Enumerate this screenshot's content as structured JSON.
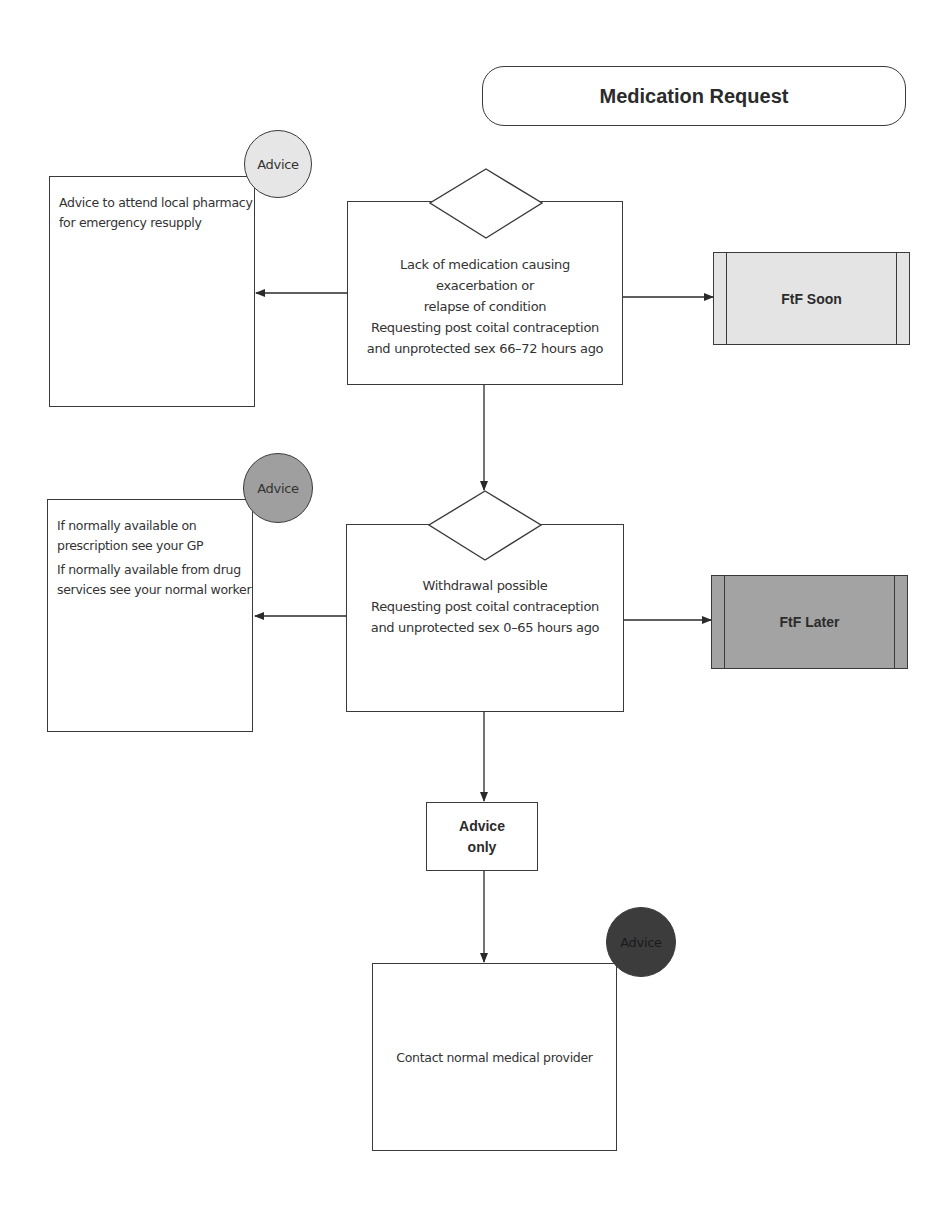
{
  "diagram": {
    "title": "Medication Request",
    "colors": {
      "advice_light": "#e6e6e6",
      "advice_medium": "#9f9f9f",
      "advice_dark": "#3c3c3c",
      "ftf_soon_fill": "#e4e4e4",
      "ftf_later_fill": "#a3a3a3",
      "stroke": "#3a3a3a"
    },
    "decision_1": {
      "lines": [
        "Lack of medication causing",
        "exacerbation or",
        "relapse of condition",
        "Requesting post coital contraception",
        "and unprotected sex 66–72 hours ago"
      ]
    },
    "decision_2": {
      "lines": [
        "Withdrawal possible",
        "Requesting post coital contraception",
        "and unprotected sex 0–65 hours ago"
      ]
    },
    "advice_1": {
      "badge": "Advice",
      "badge_shade": "light",
      "paragraphs": [
        "Advice to attend local pharmacy for emergency resupply"
      ]
    },
    "advice_2": {
      "badge": "Advice",
      "badge_shade": "medium",
      "paragraphs": [
        "If normally available on prescription see your GP",
        "If normally available from drug services see your normal worker"
      ]
    },
    "outcome_1": {
      "label": "FtF Soon",
      "shade": "light"
    },
    "outcome_2": {
      "label": "FtF Later",
      "shade": "medium"
    },
    "advice_only": {
      "lines": [
        "Advice",
        "only"
      ]
    },
    "final": {
      "badge": "Advice",
      "badge_shade": "dark",
      "text": "Contact normal medical provider"
    }
  }
}
